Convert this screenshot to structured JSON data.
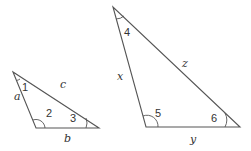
{
  "diagram": {
    "type": "two-triangles-angles",
    "stroke_color": "#555555",
    "triangles": [
      {
        "id": "small",
        "sides": {
          "left": "a",
          "hypotenuse": "c",
          "bottom": "b"
        },
        "angles": {
          "top": "1",
          "bottom_left": "2",
          "bottom_right": "3"
        }
      },
      {
        "id": "large",
        "sides": {
          "left": "x",
          "hypotenuse": "z",
          "bottom": "y"
        },
        "angles": {
          "top": "4",
          "bottom_left": "5",
          "bottom_right": "6"
        }
      }
    ]
  }
}
